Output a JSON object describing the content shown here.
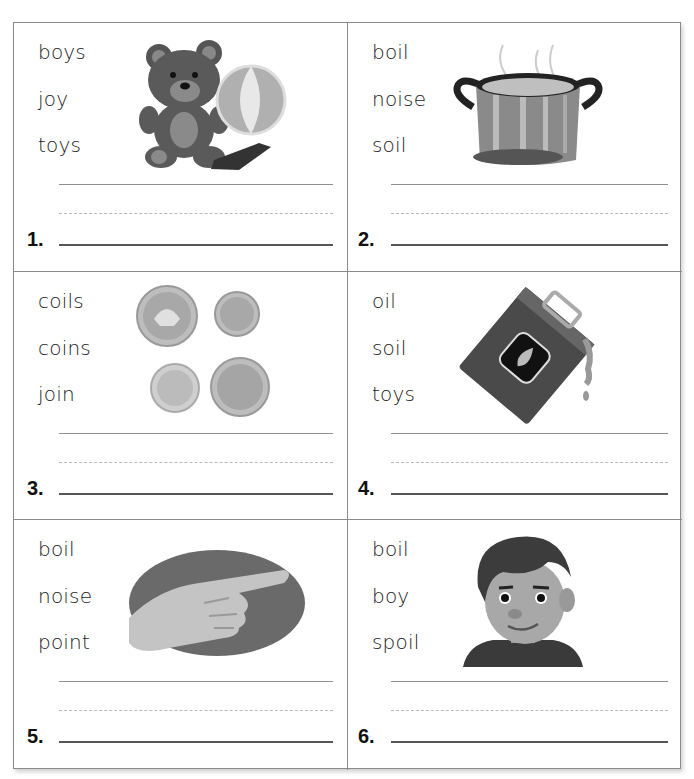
{
  "worksheet": {
    "cells": [
      {
        "number": "1.",
        "words": [
          "boys",
          "joy",
          "toys"
        ],
        "picture": "teddy-bear-ball-boat"
      },
      {
        "number": "2.",
        "words": [
          "boil",
          "noise",
          "soil"
        ],
        "picture": "boiling-pot"
      },
      {
        "number": "3.",
        "words": [
          "coils",
          "coins",
          "join"
        ],
        "picture": "coins"
      },
      {
        "number": "4.",
        "words": [
          "oil",
          "soil",
          "toys"
        ],
        "picture": "oil-can"
      },
      {
        "number": "5.",
        "words": [
          "boil",
          "noise",
          "point"
        ],
        "picture": "pointing-hand"
      },
      {
        "number": "6.",
        "words": [
          "boil",
          "boy",
          "spoil"
        ],
        "picture": "boy-portrait"
      }
    ]
  },
  "colors": {
    "border": "#8a8a8a",
    "text": "#1a1a1a",
    "guide_solid": "#8f8f8f",
    "guide_dashed": "#b8b8b8",
    "baseline": "#555555"
  }
}
